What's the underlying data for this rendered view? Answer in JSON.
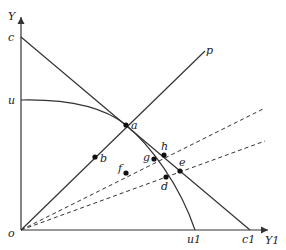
{
  "diagram": {
    "axes": {
      "y_label": "Y",
      "x_label": "Y1",
      "origin_label": "o"
    },
    "intercept_labels": {
      "c": "c",
      "u": "u",
      "c1": "c1",
      "u1": "u1"
    },
    "ray_label": "p",
    "points": {
      "a": "a",
      "b": "b",
      "d": "d",
      "e": "e",
      "f": "f",
      "g": "g",
      "h": "h"
    },
    "elements": [
      {
        "type": "line",
        "name": "budget-line",
        "from": "c",
        "to": "c1"
      },
      {
        "type": "curve",
        "name": "utility-frontier",
        "from": "u",
        "to": "u1",
        "through": "a"
      },
      {
        "type": "ray",
        "name": "ray-op",
        "from": "o",
        "to": "p",
        "through": [
          "b",
          "a"
        ]
      },
      {
        "type": "dashed-ray",
        "name": "upper-dashed-ray",
        "from": "o",
        "through": [
          "g",
          "h"
        ]
      },
      {
        "type": "dashed-ray",
        "name": "lower-dashed-ray",
        "from": "o",
        "through": [
          "f",
          "d",
          "e"
        ]
      }
    ],
    "colors": {
      "line": "#333333",
      "point": "#111111",
      "background": "#ffffff"
    }
  }
}
